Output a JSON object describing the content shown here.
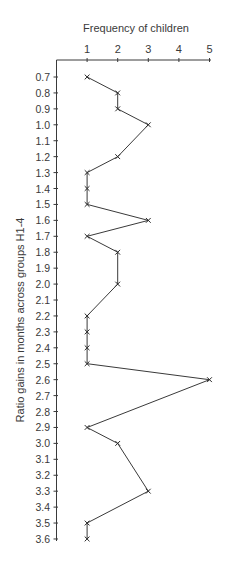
{
  "chart_data": {
    "type": "line",
    "orientation": "horizontal-values-vertical-categories",
    "title": "",
    "xlabel": "Frequency of children",
    "ylabel": "Ratio gains in months across groups H1-4",
    "x_ticks": [
      "1",
      "2",
      "3",
      "4",
      "5"
    ],
    "xlim": [
      0,
      5
    ],
    "y_ticks": [
      "0.7",
      "0.8",
      "0.9",
      "1.0",
      "1.1",
      "1.2",
      "1.3",
      "1.4",
      "1.5",
      "1.6",
      "1.7",
      "1.8",
      "1.9",
      "2.0",
      "2.1",
      "2.2",
      "2.3",
      "2.4",
      "2.5",
      "2.6",
      "2.7",
      "2.8",
      "2.9",
      "3.0",
      "3.1",
      "3.2",
      "3.3",
      "3.4",
      "3.5",
      "3.6"
    ],
    "ylim": [
      0.7,
      3.6
    ],
    "x_axis_position": "top",
    "grid": false,
    "legend": "none",
    "marker": "x",
    "series": [
      {
        "name": "Frequency",
        "points": [
          {
            "ratio": 0.7,
            "frequency": 1
          },
          {
            "ratio": 0.8,
            "frequency": 2
          },
          {
            "ratio": 0.9,
            "frequency": 2
          },
          {
            "ratio": 1.0,
            "frequency": 3
          },
          {
            "ratio": 1.2,
            "frequency": 2
          },
          {
            "ratio": 1.3,
            "frequency": 1
          },
          {
            "ratio": 1.4,
            "frequency": 1
          },
          {
            "ratio": 1.5,
            "frequency": 1
          },
          {
            "ratio": 1.6,
            "frequency": 3
          },
          {
            "ratio": 1.7,
            "frequency": 1
          },
          {
            "ratio": 1.8,
            "frequency": 2
          },
          {
            "ratio": 2.0,
            "frequency": 2
          },
          {
            "ratio": 2.2,
            "frequency": 1
          },
          {
            "ratio": 2.3,
            "frequency": 1
          },
          {
            "ratio": 2.4,
            "frequency": 1
          },
          {
            "ratio": 2.5,
            "frequency": 1
          },
          {
            "ratio": 2.6,
            "frequency": 5
          },
          {
            "ratio": 2.9,
            "frequency": 1
          },
          {
            "ratio": 3.0,
            "frequency": 2
          },
          {
            "ratio": 3.3,
            "frequency": 3
          },
          {
            "ratio": 3.5,
            "frequency": 1
          },
          {
            "ratio": 3.6,
            "frequency": 1
          }
        ]
      }
    ]
  }
}
